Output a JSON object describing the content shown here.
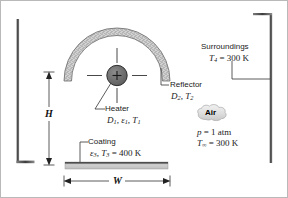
{
  "figure": {
    "name": "radiant-heater-with-reflector-schematic",
    "background": "#ffffff",
    "border_color": "#b9b9b9"
  },
  "labels": {
    "reflector": {
      "title": "Reflector",
      "params": "D2, T2",
      "param_symbols": [
        "D",
        "T"
      ],
      "param_subs": [
        "2",
        "2"
      ]
    },
    "heater": {
      "title": "Heater",
      "params": "D1, e1, T1"
    },
    "coating": {
      "title": "Coating",
      "params": "e3, T3 = 400 K",
      "temperature": "400 K"
    },
    "surroundings": {
      "title": "Surroundings",
      "params": "T4 = 300 K",
      "temperature": "300 K"
    },
    "air": {
      "title": "Air",
      "pressure": "p = 1 atm",
      "pressure_value": "1 atm",
      "temperature": "Tinf = 300 K",
      "temperature_value": "300 K"
    }
  },
  "dimensions": {
    "height_symbol": "H",
    "width_symbol": "W"
  },
  "colors": {
    "line": "#333333",
    "heater_fill": "#6e6e6e",
    "reflector_fill": "#c9c9c9",
    "plate_fill": "#c4c4c4",
    "wall": "#4a4a4a",
    "cloud_fill": "#e3e3e3"
  },
  "symbols": {
    "epsilon": "ε",
    "infinity": "∞",
    "plus": "+"
  }
}
